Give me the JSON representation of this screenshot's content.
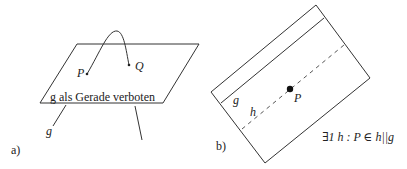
{
  "panel_a": {
    "label": "a)",
    "point_p": "P",
    "point_q": "Q",
    "plane_caption": "g als Gerade verboten",
    "line_label": "g"
  },
  "panel_b": {
    "label": "b)",
    "line_g_label": "g",
    "line_h_label": "h",
    "point_p": "P",
    "statement": "∃1 h : P ∈ h||g"
  },
  "colors": {
    "stroke": "#333333",
    "text": "#222222"
  }
}
